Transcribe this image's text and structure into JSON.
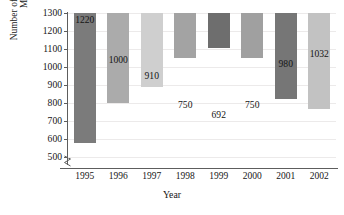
{
  "chart_data": {
    "type": "bar",
    "title": "",
    "subtitle": "",
    "xlabel": "Year",
    "ylabel_lines": [
      "Number of Gang-Related",
      "Murders"
    ],
    "ylabel": "Number of Gang-Related Murders",
    "categories": [
      "1995",
      "1996",
      "1997",
      "1998",
      "1999",
      "2000",
      "2001",
      "2002"
    ],
    "values": [
      1220,
      1000,
      910,
      750,
      692,
      750,
      980,
      1032
    ],
    "value_labels": [
      "1220",
      "1000",
      "910",
      "750",
      "692",
      "750",
      "980",
      "1032"
    ],
    "ylim": [
      500,
      1300
    ],
    "y_axis_break": true,
    "y_axis_break_glyph": "zigzag",
    "ytick_labels": [
      "1300",
      "1200",
      "1100",
      "1000",
      "900",
      "800",
      "700",
      "600",
      "500"
    ],
    "ytick_values": [
      1300,
      1200,
      1100,
      1000,
      900,
      800,
      700,
      600,
      500
    ],
    "grid": "horizontal",
    "legend": "none",
    "bar_colors": [
      "#7b7b7b",
      "#ababab",
      "#cfcfcf",
      "#a3a3a3",
      "#6e6e6e",
      "#a0a0a0",
      "#767676",
      "#c2c2c2"
    ],
    "axis_color": "#5d5d5d",
    "gridline_color": "#eceaea",
    "background_color": "#ffffff"
  }
}
